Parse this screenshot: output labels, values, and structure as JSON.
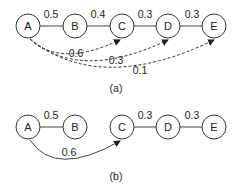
{
  "diagram_a": {
    "caption": "(a)",
    "nodes": [
      "A",
      "B",
      "C",
      "D",
      "E"
    ],
    "edges": [
      {
        "from": "A",
        "to": "B",
        "weight": "0.5"
      },
      {
        "from": "B",
        "to": "C",
        "weight": "0.4"
      },
      {
        "from": "C",
        "to": "D",
        "weight": "0.3"
      },
      {
        "from": "D",
        "to": "E",
        "weight": "0.3"
      }
    ],
    "dashed_arcs": [
      {
        "from": "A",
        "to": "C",
        "weight": "0.6"
      },
      {
        "from": "A",
        "to": "D",
        "weight": "0.3"
      },
      {
        "from": "A",
        "to": "E",
        "weight": "0.1"
      }
    ]
  },
  "diagram_b": {
    "caption": "(b)",
    "nodes": [
      "A",
      "B",
      "C",
      "D",
      "E"
    ],
    "edges": [
      {
        "from": "A",
        "to": "B",
        "weight": "0.5"
      },
      {
        "from": "C",
        "to": "D",
        "weight": "0.3"
      },
      {
        "from": "D",
        "to": "E",
        "weight": "0.3"
      }
    ],
    "solid_arcs": [
      {
        "from": "A",
        "to": "C",
        "weight": "0.6"
      }
    ]
  }
}
